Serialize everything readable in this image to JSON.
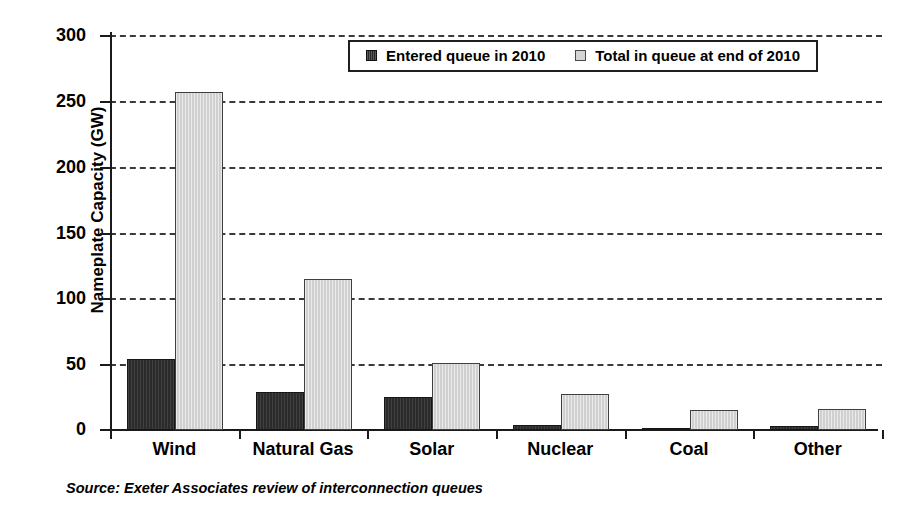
{
  "chart_data": {
    "type": "bar",
    "title": "",
    "xlabel": "",
    "ylabel": "Nameplate Capacity (GW)",
    "ylim": [
      0,
      300
    ],
    "ytick_step": 50,
    "yticks": [
      0,
      50,
      100,
      150,
      200,
      250,
      300
    ],
    "ytick_labels": [
      "0",
      "50",
      "100",
      "150",
      "200",
      "250",
      "300"
    ],
    "grid": "horizontal-dashed",
    "legend_position": "top-center-inside",
    "categories": [
      "Wind",
      "Natural Gas",
      "Solar",
      "Nuclear",
      "Coal",
      "Other"
    ],
    "series": [
      {
        "name": "Entered queue in 2010",
        "color": "#2b2b2b",
        "values": [
          54,
          29,
          25,
          3.5,
          0.6,
          3
        ]
      },
      {
        "name": "Total in queue at end of 2010",
        "color": "#d0d0d0",
        "values": [
          257,
          115,
          51,
          27,
          15,
          16
        ]
      }
    ],
    "annotations": [
      "Source: Exeter Associates review of interconnection queues"
    ]
  },
  "axis": {
    "y_title": "Nameplate Capacity (GW)",
    "tick_labels": [
      "300",
      "250",
      "200",
      "150",
      "100",
      "50",
      "0"
    ],
    "category_labels": [
      "Wind",
      "Natural Gas",
      "Solar",
      "Nuclear",
      "Coal",
      "Other"
    ]
  },
  "legend": {
    "entries": [
      {
        "label": "Entered queue in 2010",
        "swatch": "dark-square-icon"
      },
      {
        "label": "Total in queue at end of 2010",
        "swatch": "light-square-icon"
      }
    ]
  },
  "footer": {
    "source": "Source: Exeter Associates review of interconnection queues"
  }
}
